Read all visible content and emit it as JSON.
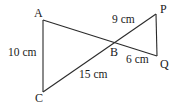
{
  "diagram": {
    "type": "geometry",
    "points": {
      "A": {
        "label": "A",
        "x": 43,
        "y": 20
      },
      "B": {
        "label": "B",
        "x": 114,
        "y": 41
      },
      "C": {
        "label": "C",
        "x": 43,
        "y": 92
      },
      "P": {
        "label": "P",
        "x": 156,
        "y": 14
      },
      "Q": {
        "label": "Q",
        "x": 157,
        "y": 56
      }
    },
    "segments": [
      {
        "from": "A",
        "to": "C"
      },
      {
        "from": "A",
        "to": "Q"
      },
      {
        "from": "C",
        "to": "P"
      },
      {
        "from": "P",
        "to": "Q"
      }
    ],
    "measurements": {
      "AC": "10 cm",
      "BC": "15 cm",
      "BP": "9 cm",
      "BQ": "6 cm"
    },
    "stroke_color": "#2a2a2a"
  }
}
